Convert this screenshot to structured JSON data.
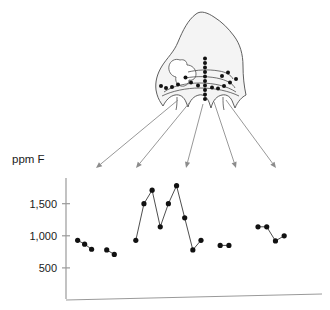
{
  "figure": {
    "title": "",
    "diagram": {
      "name": "tooth-cross-section",
      "description": "tooth-enamel-cross-section-with-sampling-points",
      "fill_color": "#f4f4f4",
      "stroke_color": "#4d4d4d",
      "sample_dot_color": "#111111",
      "sample_points": [
        [
          185.5,
          77.5
        ],
        [
          191.0,
          82.5
        ],
        [
          198.0,
          85.5
        ],
        [
          178.0,
          84.5
        ],
        [
          172.0,
          87.0
        ],
        [
          166.0,
          88.0
        ],
        [
          161.0,
          86.0
        ],
        [
          205.0,
          63.0
        ],
        [
          205.0,
          67.5
        ],
        [
          205.0,
          72.0
        ],
        [
          205.0,
          76.5
        ],
        [
          205.0,
          81.0
        ],
        [
          205.0,
          85.5
        ],
        [
          205.0,
          90.0
        ],
        [
          205.0,
          94.5
        ],
        [
          205.0,
          99.0
        ],
        [
          205.0,
          58.5
        ],
        [
          212.0,
          87.5
        ],
        [
          218.0,
          88.5
        ],
        [
          224.0,
          86.0
        ],
        [
          230.0,
          82.5
        ],
        [
          236.0,
          79.0
        ],
        [
          228.0,
          72.5
        ],
        [
          222.0,
          76.0
        ]
      ],
      "arrow_color": "#8c8c8c",
      "arrows": [
        {
          "x1": 178,
          "y1": 100,
          "x2": 96,
          "y2": 168
        },
        {
          "x1": 190,
          "y1": 102,
          "x2": 136,
          "y2": 168
        },
        {
          "x1": 203,
          "y1": 104,
          "x2": 186,
          "y2": 168
        },
        {
          "x1": 214,
          "y1": 102,
          "x2": 236,
          "y2": 168
        },
        {
          "x1": 226,
          "y1": 100,
          "x2": 276,
          "y2": 168
        }
      ]
    }
  },
  "chart_data": {
    "type": "line",
    "title": "",
    "subtitle": "",
    "xlabel": "",
    "ylabel": "ppm F",
    "ylabel_position": "above-axis",
    "grid": false,
    "legend": false,
    "legend_position": "none",
    "xlim": [
      0,
      44
    ],
    "ylim": [
      0,
      1900
    ],
    "y_ticks": [
      500,
      1000,
      1500
    ],
    "y_tick_labels": [
      "500",
      "1,000",
      "1,500"
    ],
    "x_ticks": [],
    "x_tick_labels": [],
    "marker": "filled-circle",
    "marker_color": "#111111",
    "line_color": "#3a3a3a",
    "axis_color": "#9a9a9a",
    "series": [
      {
        "name": "profile-1",
        "x": [
          2.0,
          3.2,
          4.4
        ],
        "values": [
          930,
          870,
          790
        ]
      },
      {
        "name": "profile-2",
        "x": [
          7.0,
          8.3
        ],
        "values": [
          780,
          710
        ]
      },
      {
        "name": "profile-3",
        "x": [
          12.0,
          13.4,
          14.8,
          16.2,
          17.6,
          19.0,
          20.4,
          21.8,
          23.2
        ],
        "values": [
          930,
          1500,
          1710,
          1140,
          1500,
          1780,
          1280,
          780,
          930
        ]
      },
      {
        "name": "profile-4",
        "x": [
          26.5,
          28.0
        ],
        "values": [
          850,
          850
        ]
      },
      {
        "name": "profile-5",
        "x": [
          33.0,
          34.5,
          36.0,
          37.5
        ],
        "values": [
          1140,
          1140,
          920,
          1000
        ]
      }
    ]
  }
}
